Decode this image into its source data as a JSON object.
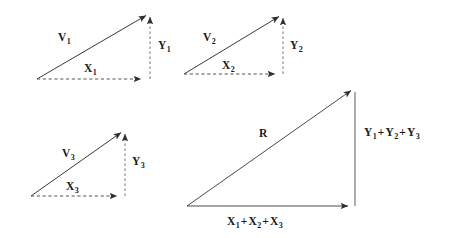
{
  "figure": {
    "background_color": "#ffffff",
    "stroke_color": "#3a3a3a",
    "dash_color": "#555555",
    "text_color": "#1a1a1a"
  },
  "panels": [
    {
      "name": "vector-1",
      "vector_label": "V",
      "vector_sub": "1",
      "x_label": "X",
      "x_sub": "1",
      "y_label": "Y",
      "y_sub": "1",
      "origin": [
        37,
        79
      ],
      "tip": [
        148,
        14
      ],
      "corner": [
        148,
        79
      ],
      "solid_edges": [
        "hypotenuse"
      ],
      "dashed_edges": [
        "x-component",
        "y-component"
      ]
    },
    {
      "name": "vector-2",
      "vector_label": "V",
      "vector_sub": "2",
      "x_label": "X",
      "x_sub": "2",
      "y_label": "Y",
      "y_sub": "2",
      "origin": [
        184,
        74
      ],
      "tip": [
        281,
        15
      ],
      "corner": [
        281,
        74
      ],
      "solid_edges": [
        "hypotenuse"
      ],
      "dashed_edges": [
        "x-component",
        "y-component"
      ]
    },
    {
      "name": "vector-3",
      "vector_label": "V",
      "vector_sub": "3",
      "x_label": "X",
      "x_sub": "3",
      "y_label": "Y",
      "y_sub": "3",
      "origin": [
        31,
        196
      ],
      "tip": [
        123,
        131
      ],
      "corner": [
        123,
        196
      ],
      "solid_edges": [
        "hypotenuse"
      ],
      "dashed_edges": [
        "x-component",
        "y-component"
      ]
    }
  ],
  "resultant": {
    "name": "resultant",
    "vector_label": "R",
    "x_label_parts": [
      "X",
      "1",
      "+",
      "X",
      "2",
      "+",
      "X",
      "3"
    ],
    "y_label_parts": [
      "Y",
      "1",
      "+",
      "Y",
      "2",
      "+",
      "Y",
      "3"
    ],
    "x_label_text": "X1 + X2 + X3",
    "y_label_text": "Y1 + Y2 + Y3",
    "origin": [
      187,
      206
    ],
    "tip": [
      353,
      89
    ],
    "corner": [
      353,
      206
    ],
    "solid_edges": [
      "hypotenuse",
      "x-component",
      "y-component"
    ]
  },
  "labels": {
    "v1": {
      "base": "V",
      "sub": "1"
    },
    "x1": {
      "base": "X",
      "sub": "1"
    },
    "y1": {
      "base": "Y",
      "sub": "1"
    },
    "v2": {
      "base": "V",
      "sub": "2"
    },
    "x2": {
      "base": "X",
      "sub": "2"
    },
    "y2": {
      "base": "Y",
      "sub": "2"
    },
    "v3": {
      "base": "V",
      "sub": "3"
    },
    "x3": {
      "base": "X",
      "sub": "3"
    },
    "y3": {
      "base": "Y",
      "sub": "3"
    },
    "r": {
      "base": "R",
      "sub": ""
    },
    "sum_x": {
      "t1": "X",
      "s1": "1",
      "o1": "+",
      "t2": "X",
      "s2": "2",
      "o2": "+",
      "t3": "X",
      "s3": "3"
    },
    "sum_y": {
      "t1": "Y",
      "s1": "1",
      "o1": "+",
      "t2": "Y",
      "s2": "2",
      "o2": "+",
      "t3": "Y",
      "s3": "3"
    }
  }
}
